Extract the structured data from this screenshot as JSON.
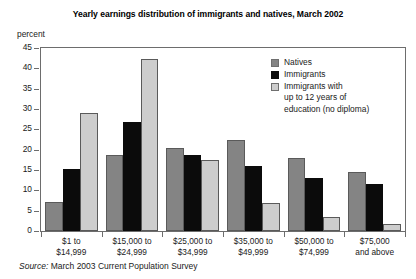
{
  "chart_data": {
    "type": "bar",
    "title": "Yearly earnings distribution of immigrants and natives, March 2002",
    "xlabel": "",
    "ylabel": "percent",
    "ylim": [
      0,
      45
    ],
    "yticks": [
      0,
      5,
      10,
      15,
      20,
      25,
      30,
      35,
      40,
      45
    ],
    "grid": false,
    "legend_position": "upper right",
    "categories": [
      "$1 to\n$14,999",
      "$15,000 to\n$24,999",
      "$25,000 to\n$34,999",
      "$35,000 to\n$49,999",
      "$50,000 to\n$74,999",
      "$75,000\nand above"
    ],
    "category_lines": [
      [
        "$1 to",
        "$14,999"
      ],
      [
        "$15,000 to",
        "$24,999"
      ],
      [
        "$25,000 to",
        "$34,999"
      ],
      [
        "$35,000 to",
        "$49,999"
      ],
      [
        "$50,000 to",
        "$74,999"
      ],
      [
        "$75,000",
        "and above"
      ]
    ],
    "series": [
      {
        "name": "Natives",
        "color": "#848484",
        "values": [
          7.2,
          18.6,
          20.4,
          22.5,
          18.0,
          14.5
        ]
      },
      {
        "name": "Immigrants",
        "color": "#0b0b0b",
        "values": [
          15.3,
          26.9,
          18.7,
          16.1,
          13.0,
          11.5
        ]
      },
      {
        "name": "Immigrants with up to 12 years of education (no diploma)",
        "color": "#cdcdcd",
        "values": [
          29.0,
          42.4,
          17.4,
          6.9,
          3.5,
          1.8
        ]
      }
    ],
    "annotations": {
      "source_prefix": "Source:",
      "source_text": " March 2003 Current Population Survey"
    }
  },
  "legend": {
    "items": [
      {
        "label": "Natives",
        "swatch": "natives"
      },
      {
        "label": "Immigrants",
        "swatch": "immig"
      },
      {
        "label": "Immigrants with",
        "swatch": "immig12"
      }
    ],
    "third_line_2": "up to 12 years of",
    "third_line_3": "education (no diploma)"
  }
}
